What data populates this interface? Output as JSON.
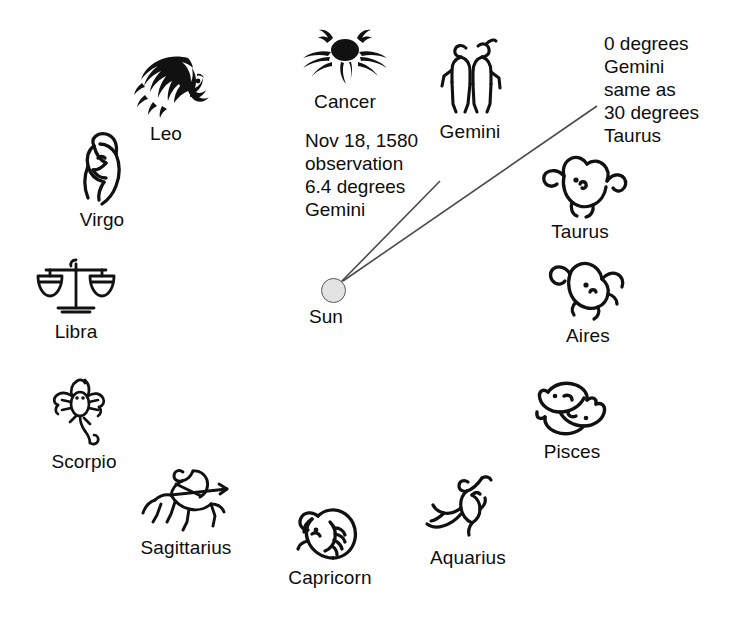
{
  "diagram": {
    "background_color": "#ffffff",
    "ink_color": "#0d0d0d",
    "line_color": "#4a4a4a",
    "sun": {
      "label": "Sun",
      "fill_color": "#e3e3e3",
      "stroke_color": "#595959",
      "center_x": 333,
      "center_y": 290,
      "radius": 12.5
    },
    "annotations": [
      {
        "id": "observation",
        "lines": [
          "Nov 18, 1580",
          "observation",
          "6.4 degrees",
          "Gemini"
        ],
        "text": "Nov 18, 1580\nobservation\n6.4 degrees\nGemini",
        "x": 305,
        "y": 129
      },
      {
        "id": "gemini-taurus-boundary",
        "lines": [
          "0 degrees",
          "Gemini",
          "same as",
          "30 degrees",
          "Taurus"
        ],
        "text": "0 degrees\nGemini\nsame as\n30 degrees\nTaurus",
        "x": 604,
        "y": 32
      }
    ],
    "sight_lines": [
      {
        "id": "observation-sightline",
        "from_x": 341,
        "from_y": 282,
        "to_x": 440,
        "to_y": 181,
        "degrees": 6.4,
        "sign": "Gemini"
      },
      {
        "id": "boundary-sightline",
        "from_x": 343,
        "from_y": 281,
        "to_x": 597,
        "to_y": 106,
        "degrees": 0,
        "sign": "Gemini"
      }
    ],
    "signs": [
      {
        "id": "leo",
        "label": "Leo",
        "symbol": "lion-head",
        "x": 106,
        "y": 50,
        "order": 1
      },
      {
        "id": "cancer",
        "label": "Cancer",
        "symbol": "crab",
        "x": 285,
        "y": 22,
        "order": 2
      },
      {
        "id": "gemini",
        "label": "Gemini",
        "symbol": "twins",
        "x": 410,
        "y": 32,
        "order": 3
      },
      {
        "id": "taurus",
        "label": "Taurus",
        "symbol": "bull-head",
        "x": 520,
        "y": 148,
        "order": 4
      },
      {
        "id": "aires",
        "label": "Aires",
        "symbol": "ram-head",
        "x": 528,
        "y": 252,
        "order": 5
      },
      {
        "id": "pisces",
        "label": "Pisces",
        "symbol": "two-fish",
        "x": 512,
        "y": 368,
        "order": 6
      },
      {
        "id": "aquarius",
        "label": "Aquarius",
        "symbol": "water-bearer",
        "x": 408,
        "y": 468,
        "order": 7
      },
      {
        "id": "capricorn",
        "label": "Capricorn",
        "symbol": "goat-head",
        "x": 270,
        "y": 500,
        "order": 8
      },
      {
        "id": "sagittarius",
        "label": "Sagittarius",
        "symbol": "archer-centaur",
        "x": 126,
        "y": 460,
        "order": 9
      },
      {
        "id": "scorpio",
        "label": "Scorpio",
        "symbol": "scorpion",
        "x": 24,
        "y": 370,
        "order": 10
      },
      {
        "id": "libra",
        "label": "Libra",
        "symbol": "scales",
        "x": 16,
        "y": 250,
        "order": 11
      },
      {
        "id": "virgo",
        "label": "Virgo",
        "symbol": "maiden",
        "x": 42,
        "y": 128,
        "order": 12
      }
    ]
  }
}
